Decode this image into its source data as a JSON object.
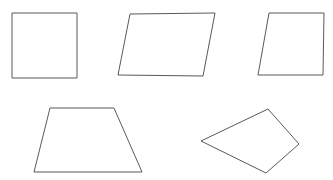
{
  "figure": {
    "background_color": "#ffffff",
    "stroke_color": "#59595b",
    "fill_color": "#ffffff",
    "stroke_width": 1,
    "width": 333,
    "height": 180
  },
  "shapes": [
    {
      "id": "square",
      "name": "square",
      "label": "Square",
      "row": 1,
      "position": 1,
      "points": "12,13 77,13 77,78 12,78"
    },
    {
      "id": "parallelogram-wide",
      "name": "parallelogram",
      "label": "Parallelogram",
      "row": 1,
      "position": 2,
      "points": "130,14 215,13 203,76 118,75"
    },
    {
      "id": "rhombus-narrow",
      "name": "slanted-parallelogram",
      "label": "Slanted parallelogram",
      "row": 1,
      "position": 3,
      "points": "269,13 324,13 323,75 258,75"
    },
    {
      "id": "trapezoid",
      "name": "trapezoid",
      "label": "Trapezoid",
      "row": 2,
      "position": 1,
      "points": "50,108 114,108 142,172 34,172"
    },
    {
      "id": "irregular-quadrilateral",
      "name": "irregular-quadrilateral",
      "label": "Irregular quadrilateral",
      "row": 2,
      "position": 2,
      "points": "268,109 299,144 266,173 201,141"
    }
  ]
}
